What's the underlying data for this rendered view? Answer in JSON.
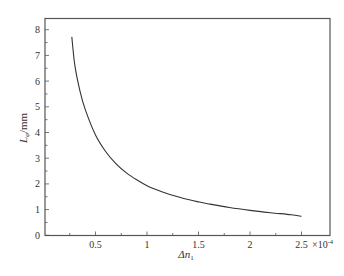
{
  "chart_data": {
    "type": "line",
    "title": "",
    "xlabel": "Δn₁",
    "xlabel_main": "Δn",
    "xlabel_sub": "1",
    "ylabel": "L_φ/mm",
    "ylabel_main": "L",
    "ylabel_sub": "φ",
    "ylabel_unit": "/mm",
    "x_exponent_label": "×10",
    "x_exponent": "-4",
    "xlim": [
      0,
      2.6
    ],
    "ylim": [
      0,
      8.2
    ],
    "xticks": [
      0.5,
      1,
      1.5,
      2,
      2.5
    ],
    "xtick_labels": [
      "0.5",
      "1",
      "1.5",
      "2",
      "2.5"
    ],
    "xminor_step": 0.25,
    "yticks": [
      0,
      1,
      2,
      3,
      4,
      5,
      6,
      7,
      8
    ],
    "ytick_labels": [
      "0",
      "1",
      "2",
      "3",
      "4",
      "5",
      "6",
      "7",
      "8"
    ],
    "yminor_step": 0.5,
    "grid": false,
    "legend": null,
    "line_color": "#333333",
    "series": [
      {
        "name": "L_φ vs Δn₁",
        "x": [
          0.27,
          0.3,
          0.35,
          0.4,
          0.5,
          0.6,
          0.7,
          0.8,
          0.9,
          1.0,
          1.1,
          1.2,
          1.3,
          1.4,
          1.5,
          1.6,
          1.8,
          2.0,
          2.2,
          2.4,
          2.5
        ],
        "y": [
          7.72,
          6.6,
          5.6,
          4.9,
          3.9,
          3.25,
          2.78,
          2.43,
          2.16,
          1.93,
          1.76,
          1.62,
          1.5,
          1.39,
          1.3,
          1.22,
          1.08,
          0.97,
          0.88,
          0.8,
          0.74
        ]
      }
    ]
  }
}
